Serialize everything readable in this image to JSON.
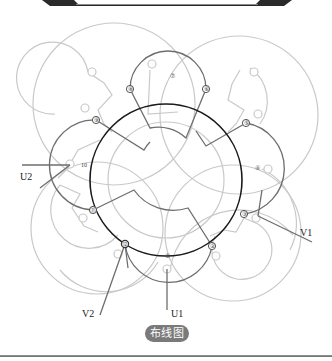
{
  "caption": "布线图",
  "phase_labels": {
    "u1": "U1",
    "u2": "U2",
    "v1": "V1",
    "v2": "V2"
  },
  "terminals": [
    {
      "id": "1",
      "label": "①"
    },
    {
      "id": "2",
      "label": "②"
    },
    {
      "id": "3",
      "label": "③"
    },
    {
      "id": "4",
      "label": "④"
    },
    {
      "id": "5",
      "label": "⑤"
    },
    {
      "id": "6",
      "label": "⑥"
    },
    {
      "id": "7",
      "label": "⑦"
    },
    {
      "id": "8",
      "label": "⑧"
    },
    {
      "id": "9",
      "label": "⑨"
    },
    {
      "id": "10",
      "label": "10"
    },
    {
      "id": "11",
      "label": "⑪"
    },
    {
      "id": "12",
      "label": "⑫"
    }
  ],
  "colors": {
    "stator": "#1a1a1a",
    "active_coil": "#6e6e6e",
    "inactive_coil": "#c8c8c8",
    "banner": "#2a2a2a",
    "pill": "#7a7a7a"
  }
}
